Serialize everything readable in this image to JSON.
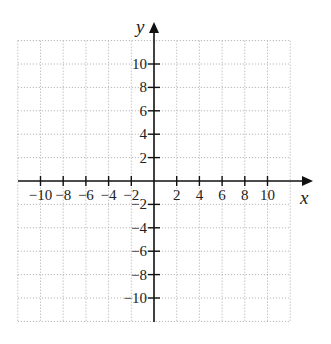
{
  "chart_data": {
    "type": "scatter",
    "title": "",
    "xlabel": "x",
    "ylabel": "y",
    "xlim": [
      -12,
      12
    ],
    "ylim": [
      -12,
      12
    ],
    "grid": true,
    "grid_step": 2,
    "x_ticks": [
      -10,
      -8,
      -6,
      -4,
      -2,
      2,
      4,
      6,
      8,
      10
    ],
    "y_ticks": [
      -10,
      -8,
      -6,
      -4,
      -2,
      2,
      4,
      6,
      8,
      10
    ],
    "x_tick_labels": [
      "−10",
      "−8",
      "−6",
      "−4",
      "−2",
      "2",
      "4",
      "6",
      "8",
      "10"
    ],
    "y_tick_labels": [
      "−10",
      "−8",
      "−6",
      "−4",
      "−2",
      "2",
      "4",
      "6",
      "8",
      "10"
    ],
    "series": [],
    "legend": null
  },
  "colors": {
    "axis": "#111111",
    "grid": "#b8b8b8",
    "text": "#222222"
  }
}
